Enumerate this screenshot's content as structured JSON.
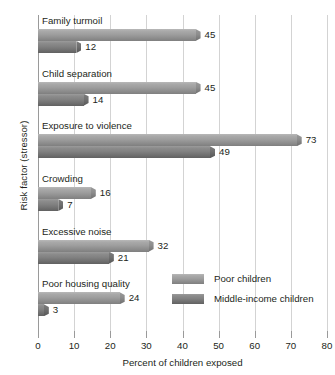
{
  "chart_data": {
    "type": "bar",
    "orientation": "horizontal",
    "title": "",
    "xlabel": "Percent of children exposed",
    "ylabel": "Risk factor (stressor)",
    "xlim": [
      0,
      80
    ],
    "xticks": [
      0,
      10,
      20,
      30,
      40,
      50,
      60,
      70,
      80
    ],
    "grid": true,
    "legend_position": "inside-lower-right",
    "categories": [
      "Family turmoil",
      "Child separation",
      "Exposure to violence",
      "Crowding",
      "Excessive noise",
      "Poor housing quality"
    ],
    "series": [
      {
        "name": "Poor children",
        "color": "#9e9e9e",
        "values": [
          45,
          45,
          73,
          16,
          32,
          24
        ]
      },
      {
        "name": "Middle-income children",
        "color": "#818181",
        "values": [
          12,
          14,
          49,
          7,
          21,
          3
        ]
      }
    ]
  },
  "legend": {
    "items": [
      {
        "label": "Poor children"
      },
      {
        "label": "Middle-income children"
      }
    ]
  }
}
